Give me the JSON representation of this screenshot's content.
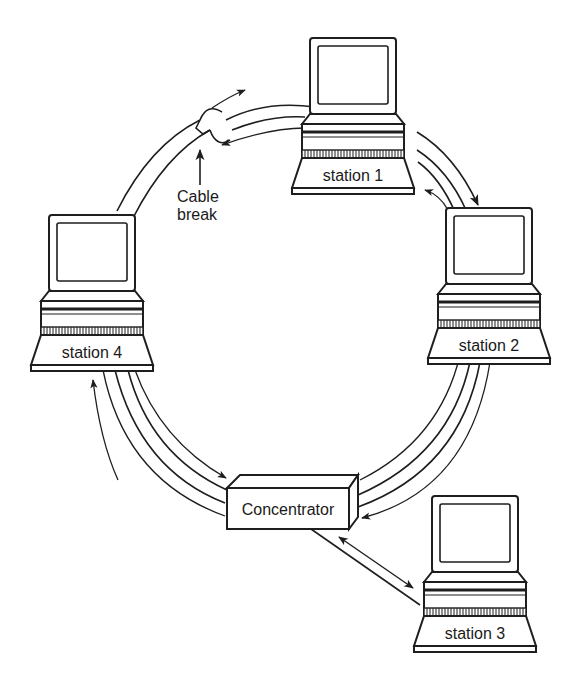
{
  "diagram": {
    "type": "token-ring network topology",
    "stations": [
      {
        "id": "station-1",
        "label": "station 1"
      },
      {
        "id": "station-2",
        "label": "station 2"
      },
      {
        "id": "station-3",
        "label": "station 3"
      },
      {
        "id": "station-4",
        "label": "station 4"
      }
    ],
    "concentrator": {
      "label": "Concentrator"
    },
    "annotation": {
      "line1": "Cable",
      "line2": "break"
    },
    "colors": {
      "line": "#1e1e1e",
      "background": "#ffffff"
    }
  }
}
